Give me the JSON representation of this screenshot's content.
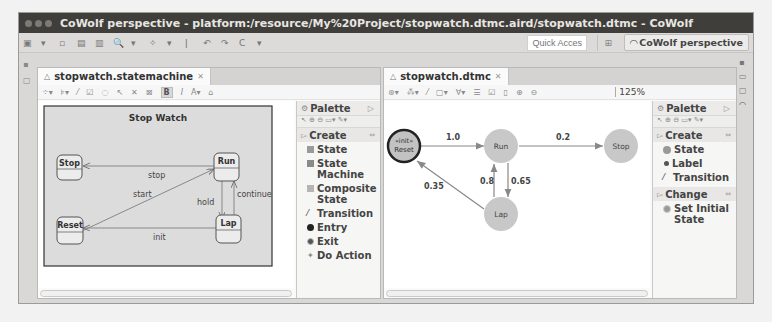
{
  "window": {
    "title": "CoWolf perspective - platform:/resource/My%20Project/stopwatch.dtmc.aird/stopwatch.dtmc - CoWolf"
  },
  "toolbar": {
    "quick_access_placeholder": "Quick Access",
    "perspective_label": "CoWolf perspective"
  },
  "left_editor": {
    "tab_label": "stopwatch.statemachine",
    "diagram": {
      "title": "Stop Watch",
      "states": [
        "Stop",
        "Run",
        "Reset",
        "Lap"
      ],
      "transitions": [
        {
          "from": "Run",
          "to": "Stop",
          "label": "stop"
        },
        {
          "from": "Reset",
          "to": "Run",
          "label": "start"
        },
        {
          "from": "Run",
          "to": "Lap",
          "label": "hold"
        },
        {
          "from": "Lap",
          "to": "Run",
          "label": "continue"
        },
        {
          "from": "Lap",
          "to": "Reset",
          "label": "init"
        }
      ]
    },
    "palette": {
      "title": "Palette",
      "drawer": "Create",
      "items": [
        "State",
        "State Machine",
        "Composite State",
        "Transition",
        "Entry",
        "Exit",
        "Do Action"
      ]
    }
  },
  "right_editor": {
    "tab_label": "stopwatch.dtmc",
    "zoom_level": "125%",
    "diagram": {
      "states": [
        {
          "name": "Reset",
          "stereotype": "«init»",
          "initial": true
        },
        {
          "name": "Run"
        },
        {
          "name": "Stop"
        },
        {
          "name": "Lap"
        }
      ],
      "transitions": [
        {
          "from": "Reset",
          "to": "Run",
          "label": "1.0"
        },
        {
          "from": "Run",
          "to": "Stop",
          "label": "0.2"
        },
        {
          "from": "Run",
          "to": "Lap",
          "label": "0.65"
        },
        {
          "from": "Lap",
          "to": "Run",
          "label": "0.8"
        },
        {
          "from": "Lap",
          "to": "Reset",
          "label": "0.35"
        }
      ]
    },
    "palette": {
      "title": "Palette",
      "drawers": [
        {
          "label": "Create",
          "items": [
            "State",
            "Label",
            "Transition"
          ]
        },
        {
          "label": "Change",
          "items": [
            "Set Initial State"
          ]
        }
      ]
    }
  },
  "colors": {
    "titlebar": "#3f3e3b",
    "state_fill_left": "#e9e9e9",
    "dtmc_state_fill": "#c8c8c8",
    "edge": "#8a8a8a"
  }
}
